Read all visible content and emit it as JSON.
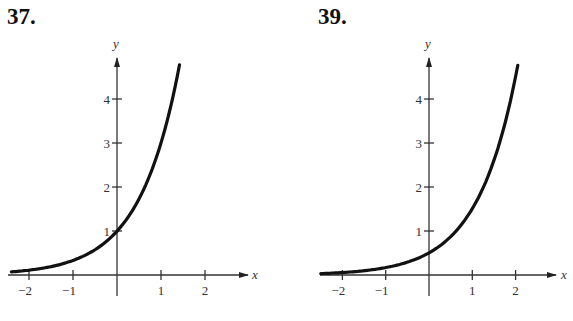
{
  "panels": [
    {
      "number": "37.",
      "x_axis_label": "x",
      "y_axis_label": "y",
      "x_ticks": [
        "−2",
        "−1",
        "1",
        "2"
      ],
      "y_ticks": [
        "1",
        "2",
        "3",
        "4"
      ]
    },
    {
      "number": "39.",
      "x_axis_label": "x",
      "y_axis_label": "y",
      "x_ticks": [
        "−2",
        "−1",
        "1",
        "2"
      ],
      "y_ticks": [
        "1",
        "2",
        "3",
        "4"
      ]
    }
  ],
  "chart_data": [
    {
      "type": "line",
      "title": "37.",
      "xlabel": "x",
      "ylabel": "y",
      "xlim": [
        -2.5,
        3
      ],
      "ylim": [
        0,
        5
      ],
      "x_ticks": [
        -2,
        -1,
        1,
        2
      ],
      "y_ticks": [
        1,
        2,
        3,
        4
      ],
      "grid": false,
      "series": [
        {
          "name": "y = 3^x",
          "x": [
            -2.4,
            -2,
            -1.5,
            -1,
            -0.5,
            0,
            0.5,
            1,
            1.2,
            1.42
          ],
          "y": [
            0.07,
            0.11,
            0.19,
            0.33,
            0.58,
            1.0,
            1.73,
            3.0,
            3.74,
            4.76
          ]
        }
      ]
    },
    {
      "type": "line",
      "title": "39.",
      "xlabel": "x",
      "ylabel": "y",
      "xlim": [
        -2.5,
        3
      ],
      "ylim": [
        0,
        5
      ],
      "x_ticks": [
        -2,
        -1,
        1,
        2
      ],
      "y_ticks": [
        1,
        2,
        3,
        4
      ],
      "grid": false,
      "series": [
        {
          "name": "y = 0.5·3^x",
          "x": [
            -2.5,
            -2,
            -1.5,
            -1,
            -0.5,
            0,
            0.5,
            1,
            1.5,
            2,
            2.05
          ],
          "y": [
            0.03,
            0.06,
            0.1,
            0.17,
            0.29,
            0.5,
            0.87,
            1.5,
            2.6,
            4.5,
            4.76
          ]
        }
      ]
    }
  ]
}
